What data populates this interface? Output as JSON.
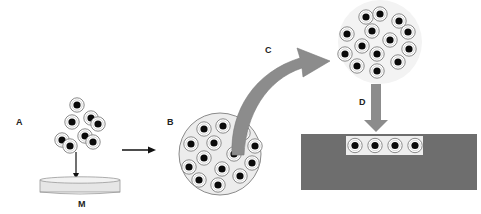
{
  "labels": {
    "a": "A",
    "b": "B",
    "c": "C",
    "d": "D",
    "m": "M"
  },
  "colors": {
    "background": "#ffffff",
    "cell_fill": "#ffffff",
    "cell_outline": "#8a8a8a",
    "nucleus": "#0a0a0a",
    "scaffold_fill": "#ececec",
    "dish_fill": "#e6e6e6",
    "curved_arrow": "#8c8c8c",
    "down_arrow": "#8c8c8c",
    "substrate": "#6e6e6e",
    "cavity": "#eeeeee",
    "line_arrow": "#111111"
  },
  "panels": {
    "a": {
      "description": "loose cell cluster dropped onto membrane",
      "cell_count": 8
    },
    "m": {
      "description": "membrane dish"
    },
    "b": {
      "description": "cells aggregated in spheroid",
      "cell_count": 17
    },
    "c": {
      "description": "curved transfer arrow"
    },
    "spheroid_top": {
      "description": "harvested cell aggregate",
      "cell_count": 16
    },
    "d": {
      "description": "downward insertion arrow"
    },
    "substrate": {
      "description": "substrate block with cavity",
      "cell_count": 4
    }
  }
}
